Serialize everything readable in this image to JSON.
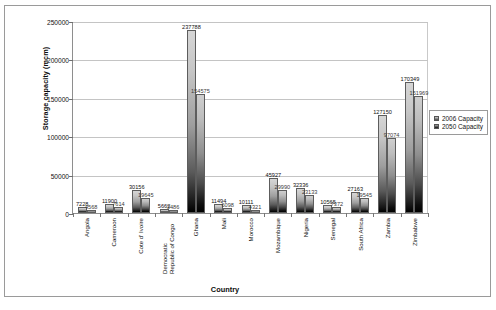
{
  "chart_data": {
    "type": "bar",
    "title": "",
    "xlabel": "Country",
    "ylabel": "Storage capacity (mcm)",
    "ylim": [
      0,
      250000
    ],
    "yticks": [
      0,
      50000,
      100000,
      150000,
      200000,
      250000
    ],
    "ytick_labels": [
      "0",
      "50000",
      "100000",
      "150000",
      "200000",
      "250000"
    ],
    "grid": true,
    "legend_position": "right",
    "categories": [
      "Angola",
      "Cameroon",
      "Cote d' Ivoire",
      "Democratic Republic of Congo",
      "Ghana",
      "Mali",
      "Morocco",
      "Mozambique",
      "Nigeria",
      "Senegal",
      "South Africa",
      "Zambia",
      "Zimbabwe"
    ],
    "series": [
      {
        "name": "2006 Capacity",
        "values": [
          7228,
          11900,
          30156,
          5662,
          237788,
          11494,
          10111,
          45927,
          32336,
          10565,
          27163,
          127150,
          170349
        ]
      },
      {
        "name": "2050 Capacity",
        "values": [
          4568,
          7614,
          19645,
          3486,
          154575,
          6098,
          4321,
          29990,
          23133,
          7372,
          19545,
          97074,
          151969
        ]
      }
    ],
    "data_labels": {
      "series_2006": [
        "7228",
        "11900",
        "30156",
        "5662",
        "237788",
        "11494",
        "10111",
        "45927",
        "32336",
        "10565",
        "27163",
        "127150",
        "170349"
      ],
      "series_2050": [
        "4568",
        "7614",
        "19645",
        "3486",
        "154575",
        "6098",
        "4321",
        "29990",
        "23133",
        "7372",
        "19545",
        "97074",
        "151969"
      ]
    }
  },
  "legend": {
    "items": [
      {
        "label": "2006 Capacity"
      },
      {
        "label": "2050 Capacity"
      }
    ]
  }
}
